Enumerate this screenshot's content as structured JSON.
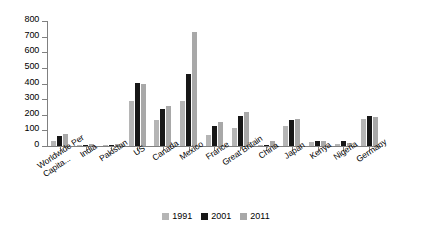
{
  "chart_data": {
    "type": "bar",
    "title": "",
    "xlabel": "",
    "ylabel": "",
    "ylim": [
      0,
      800
    ],
    "yticks": [
      0,
      100,
      200,
      300,
      400,
      500,
      600,
      700,
      800
    ],
    "grid": false,
    "legend_position": "bottom",
    "categories": [
      "Worldwide Per Capita...",
      "India",
      "Pakistan",
      "US",
      "Canada",
      "Mexico",
      "France",
      "Great Britain",
      "China",
      "Japan",
      "Kenya",
      "Nigeria",
      "Germany"
    ],
    "series": [
      {
        "name": "1991",
        "color": "#b5b5b5",
        "values": [
          35,
          4,
          3,
          290,
          165,
          290,
          70,
          115,
          5,
          125,
          25,
          10,
          170
        ]
      },
      {
        "name": "2001",
        "color": "#171717",
        "values": [
          65,
          6,
          4,
          405,
          235,
          460,
          125,
          195,
          8,
          165,
          35,
          30,
          190
        ]
      },
      {
        "name": "2011",
        "color": "#a8a8a8",
        "values": [
          80,
          12,
          15,
          400,
          255,
          730,
          155,
          215,
          35,
          170,
          35,
          20,
          185
        ]
      }
    ]
  },
  "legend": {
    "items": [
      {
        "label": "1991"
      },
      {
        "label": "2001"
      },
      {
        "label": "2011"
      }
    ]
  }
}
